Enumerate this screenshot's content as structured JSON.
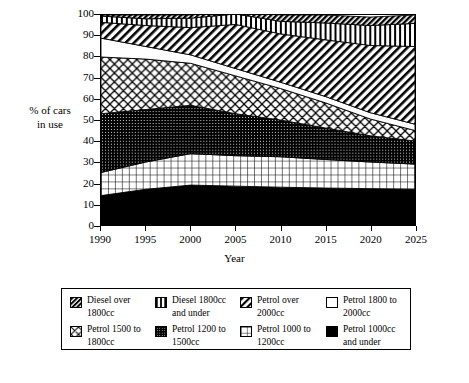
{
  "axes": {
    "y_title_line1": "% of cars",
    "y_title_line2": "in use",
    "x_title": "Year",
    "y_ticks": [
      "0",
      "10",
      "20",
      "30",
      "40",
      "50",
      "60",
      "70",
      "80",
      "90",
      "100"
    ],
    "x_ticks": [
      "1990",
      "1995",
      "2000",
      "2005",
      "2010",
      "2015",
      "2020",
      "2025"
    ]
  },
  "legend": {
    "items": [
      {
        "label": "Diesel over\n1800cc",
        "pattern": "diagonal-hatch-dense-icon"
      },
      {
        "label": "Diesel 1800cc\nand under",
        "pattern": "vertical-stripes-icon"
      },
      {
        "label": "Petrol over\n2000cc",
        "pattern": "diagonal-hatch-icon"
      },
      {
        "label": "Petrol 1800 to\n2000cc",
        "pattern": "solid-white-icon"
      },
      {
        "label": "Petrol 1500 to\n1800cc",
        "pattern": "cross-hatch-icon"
      },
      {
        "label": "Petrol 1200 to\n1500cc",
        "pattern": "dense-dots-icon"
      },
      {
        "label": "Petrol 1000 to\n1200cc",
        "pattern": "grid-icon"
      },
      {
        "label": "Petrol 1000cc\nand under",
        "pattern": "solid-black-icon"
      }
    ]
  },
  "chart_data": {
    "type": "area",
    "title": "",
    "xlabel": "Year",
    "ylabel": "% of cars in use",
    "xlim": [
      1990,
      2025
    ],
    "ylim": [
      0,
      100
    ],
    "grid": false,
    "legend_position": "bottom",
    "stacked": true,
    "x": [
      1990,
      1995,
      2000,
      2005,
      2010,
      2015,
      2020,
      2025
    ],
    "series": [
      {
        "name": "Petrol 1000cc and under",
        "pattern": "solid-black",
        "values": [
          14,
          17,
          19,
          18.5,
          18,
          17.6,
          17.3,
          17
        ]
      },
      {
        "name": "Petrol 1000 to 1200cc",
        "pattern": "grid",
        "values": [
          11,
          13,
          15,
          14.5,
          14.5,
          13.6,
          12.7,
          12
        ]
      },
      {
        "name": "Petrol 1200 to 1500cc",
        "pattern": "dense-dots",
        "values": [
          28,
          25,
          23,
          20,
          17.5,
          15,
          12.5,
          11
        ]
      },
      {
        "name": "Petrol 1500 to 1800cc",
        "pattern": "cross-hatch",
        "values": [
          27,
          24,
          20,
          18,
          15,
          12,
          8,
          5
        ]
      },
      {
        "name": "Petrol 1800 to 2000cc",
        "pattern": "solid-white",
        "values": [
          9,
          6,
          4,
          3.5,
          3,
          3,
          3,
          3
        ]
      },
      {
        "name": "Petrol over 2000cc",
        "pattern": "diagonal-hatch",
        "values": [
          7.5,
          10,
          13,
          21,
          23,
          27,
          32,
          37
        ]
      },
      {
        "name": "Diesel 1800cc and under",
        "pattern": "vertical-stripes",
        "values": [
          3,
          3.2,
          4.5,
          5,
          6,
          8,
          9.5,
          11
        ]
      },
      {
        "name": "Diesel over 1800cc",
        "pattern": "diagonal-hatch-dense",
        "values": [
          0.5,
          1.8,
          1.5,
          2.5,
          3,
          3.8,
          4,
          4
        ]
      }
    ],
    "cumulative_tops": {
      "Petrol 1000cc and under": [
        14,
        17,
        19,
        18.5,
        18,
        17.6,
        17.3,
        17
      ],
      "Petrol 1000 to 1200cc": [
        25,
        30,
        34,
        33,
        32.5,
        31.2,
        30,
        29
      ],
      "Petrol 1200 to 1500cc": [
        53,
        55,
        57,
        53,
        50,
        46.2,
        42.5,
        40
      ],
      "Petrol 1500 to 1800cc": [
        80,
        79,
        77,
        71,
        65,
        58.2,
        50.5,
        45
      ],
      "Petrol 1800 to 2000cc": [
        89,
        85,
        81,
        74.5,
        68,
        61.2,
        53.5,
        48
      ],
      "Petrol over 2000cc": [
        96.5,
        95,
        94,
        95.5,
        91,
        88.2,
        85.5,
        85
      ],
      "Diesel 1800cc and under": [
        99.5,
        98.2,
        98.5,
        97.5,
        97,
        96.2,
        95,
        96
      ],
      "Diesel over 1800cc": [
        100,
        100,
        100,
        100,
        100,
        100,
        100,
        100
      ]
    }
  }
}
